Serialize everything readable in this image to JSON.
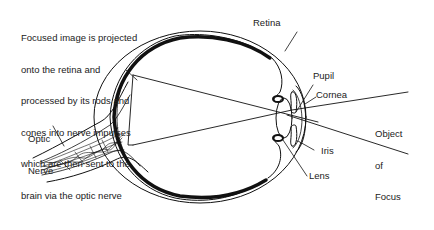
{
  "diagram": {
    "description": {
      "lines": [
        "Focused image is projected",
        "onto the retina and",
        "processed by its rods and",
        "cones into nerve impulses",
        "which are then sent to the",
        "brain via the optic nerve"
      ]
    },
    "labels": {
      "retina": "Retina",
      "pupil": "Pupil",
      "cornea": "Cornea",
      "iris": "Iris",
      "lens": "Lens",
      "optic_nerve_line1": "Optic",
      "optic_nerve_line2": "Nerve",
      "object_line1": "Object",
      "object_line2": "of",
      "object_line3": "Focus"
    },
    "colors": {
      "stroke": "#111111",
      "text": "#222222",
      "background": "#ffffff"
    }
  }
}
